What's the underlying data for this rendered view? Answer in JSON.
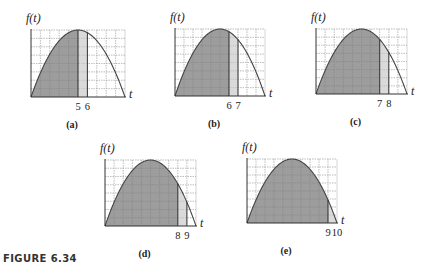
{
  "figure": {
    "caption": "FIGURE 6.34",
    "function_label": "f(t)",
    "axis_label": "t",
    "colors": {
      "area_dark": "#8c8c8c",
      "area_light": "#d6d6d6",
      "curve": "#444444",
      "axis": "#333333",
      "grid": "#b8b8b8",
      "strip_line": "#222222"
    },
    "t_range": [
      0,
      10
    ],
    "grid": {
      "columns": 10,
      "rows": 8
    },
    "panels": [
      {
        "id": "a",
        "label": "(a)",
        "shade_to": 5,
        "strip": [
          5,
          6
        ],
        "ticks": [
          "5",
          "6"
        ],
        "box": {
          "left": 31,
          "top": 30,
          "right": 125,
          "bottom": 97
        }
      },
      {
        "id": "b",
        "label": "(b)",
        "shade_to": 6,
        "strip": [
          6,
          7
        ],
        "ticks": [
          "6",
          "7"
        ],
        "box": {
          "left": 175,
          "top": 29,
          "right": 265,
          "bottom": 96
        }
      },
      {
        "id": "c",
        "label": "(c)",
        "shade_to": 7,
        "strip": [
          7,
          8
        ],
        "ticks": [
          "7",
          "8"
        ],
        "box": {
          "left": 316,
          "top": 29,
          "right": 407,
          "bottom": 94
        }
      },
      {
        "id": "d",
        "label": "(d)",
        "shade_to": 8,
        "strip": [
          8,
          9
        ],
        "ticks": [
          "8",
          "9"
        ],
        "box": {
          "left": 105,
          "top": 160,
          "right": 196,
          "bottom": 226
        }
      },
      {
        "id": "e",
        "label": "(e)",
        "shade_to": 9,
        "strip": [
          9,
          10
        ],
        "ticks": [
          "9",
          "10"
        ],
        "box": {
          "left": 247,
          "top": 159,
          "right": 337,
          "bottom": 223
        }
      }
    ]
  }
}
